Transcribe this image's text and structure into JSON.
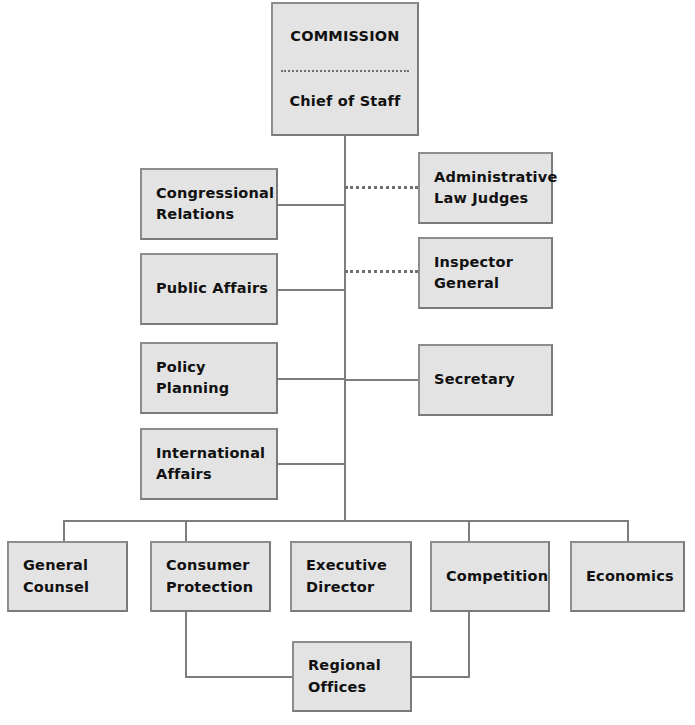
{
  "chart": {
    "type": "org-chart",
    "colors": {
      "box_fill": "#e3e3e3",
      "box_border": "#8d8d8d",
      "connector": "#7d7d7d",
      "text": "#111111",
      "background": "#ffffff"
    }
  },
  "nodes": {
    "commission": {
      "label_top": "COMMISSION",
      "label_bottom": "Chief of Staff"
    },
    "left_column": [
      {
        "line1": "Congressional",
        "line2": "Relations"
      },
      {
        "line1": "Public Affairs",
        "line2": ""
      },
      {
        "line1": "Policy Planning",
        "line2": ""
      },
      {
        "line1": "International",
        "line2": "Affairs"
      }
    ],
    "right_column": [
      {
        "line1": "Administrative",
        "line2": "Law Judges"
      },
      {
        "line1": "Inspector",
        "line2": "General"
      },
      {
        "line1": "Secretary",
        "line2": ""
      }
    ],
    "bottom_row": [
      {
        "line1": "General",
        "line2": "Counsel"
      },
      {
        "line1": "Consumer",
        "line2": "Protection"
      },
      {
        "line1": "Executive",
        "line2": "Director"
      },
      {
        "line1": "Competition",
        "line2": ""
      },
      {
        "line1": "Economics",
        "line2": ""
      }
    ],
    "regional": {
      "line1": "Regional",
      "line2": "Offices"
    }
  }
}
